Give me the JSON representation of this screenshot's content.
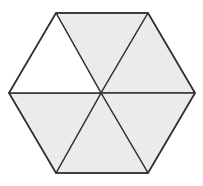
{
  "diagram": {
    "shaded_count": 5,
    "total_count": 6,
    "colors": {
      "shaded": "#ebebeb",
      "unshaded": "#ffffff",
      "stroke": "#333333",
      "background": "#ffffff"
    },
    "center": [
      101,
      93
    ],
    "vertices": [
      [
        56,
        13
      ],
      [
        148,
        13
      ],
      [
        195,
        93
      ],
      [
        148,
        173
      ],
      [
        56,
        173
      ],
      [
        9,
        93
      ]
    ],
    "triangles": [
      {
        "id": "top",
        "shaded": true
      },
      {
        "id": "upper-right",
        "shaded": true
      },
      {
        "id": "lower-right",
        "shaded": true
      },
      {
        "id": "bottom",
        "shaded": true
      },
      {
        "id": "lower-left",
        "shaded": true
      },
      {
        "id": "upper-left",
        "shaded": false
      }
    ]
  }
}
